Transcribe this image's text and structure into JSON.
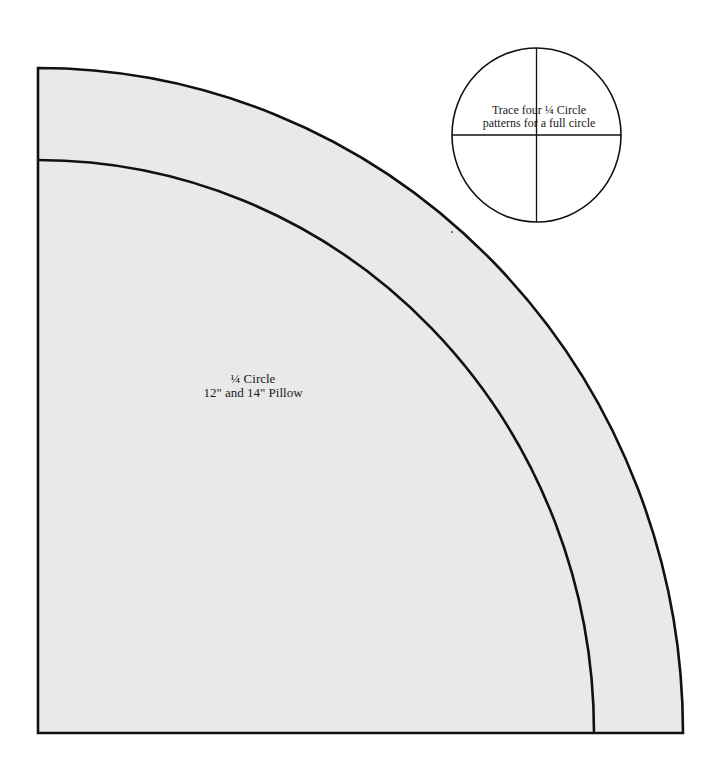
{
  "pattern": {
    "title": "¼ Circle",
    "subtitle": "12\" and 14\" Pillow",
    "fill_color": "#e9e9e9",
    "stroke_color": "#111111",
    "outer_arc": {
      "label": "cutting line"
    },
    "inner_arc": {
      "label": "seam line"
    }
  },
  "guide": {
    "line1": "Trace four ¼ Circle",
    "line2": "patterns for a full circle"
  }
}
